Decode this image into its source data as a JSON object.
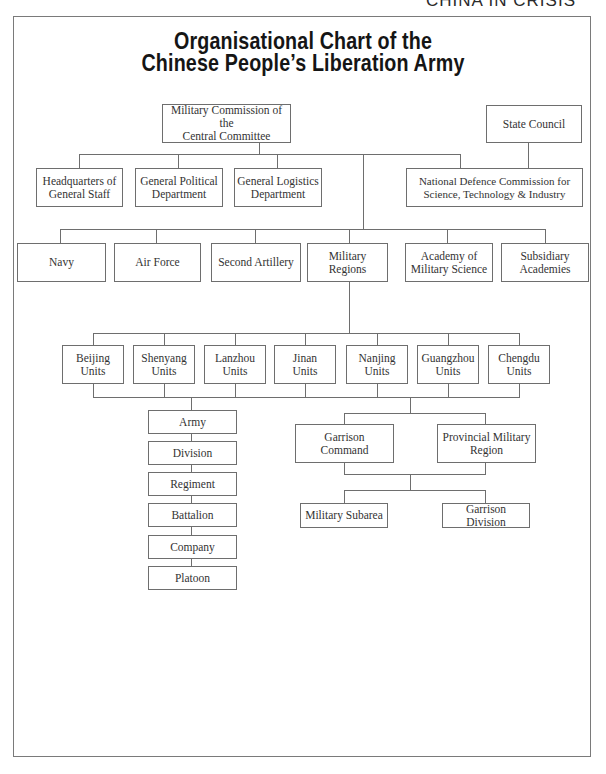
{
  "running_head": "CHINA IN CRISIS",
  "title": {
    "line1": "Organisational Chart of the",
    "line2": "Chinese People’s Liberation Army"
  },
  "top_level": {
    "military_commission": "Military Commission of the\nCentral Committee",
    "state_council": "State Council"
  },
  "departments": [
    "Headquarters of\nGeneral Staff",
    "General Political\nDepartment",
    "General Logistics\nDepartment"
  ],
  "ndc": "National Defence Commission for\nScience, Technology & Industry",
  "branches": [
    "Navy",
    "Air Force",
    "Second Artillery",
    "Military Regions",
    "Academy of\nMilitary Science",
    "Subsidiary\nAcademies"
  ],
  "regional_units": [
    "Beijing\nUnits",
    "Shenyang\nUnits",
    "Lanzhou\nUnits",
    "Jinan\nUnits",
    "Nanjing\nUnits",
    "Guangzhou\nUnits",
    "Chengdu\nUnits"
  ],
  "army_chain": [
    "Army",
    "Division",
    "Regiment",
    "Battalion",
    "Company",
    "Platoon"
  ],
  "garrison": {
    "garrison_command": "Garrison\nCommand",
    "provincial_region": "Provincial Military\nRegion",
    "military_subarea": "Military Subarea",
    "garrison_division": "Garrison Division"
  },
  "colors": {
    "line": "#6e6e6e",
    "text": "#333333",
    "title": "#151515",
    "background": "#ffffff"
  }
}
